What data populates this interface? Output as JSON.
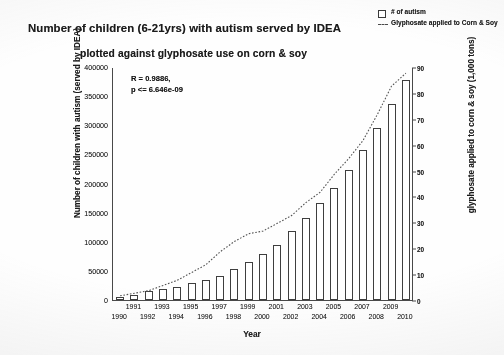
{
  "title": {
    "line1": "Number of children (6-21yrs) with autism served by IDEA",
    "line2": "plotted against glyphosate use on corn & soy"
  },
  "legend": {
    "position": "top-right",
    "items": [
      {
        "label": "# of autism",
        "marker": "open-square",
        "color": "#3f3f3f"
      },
      {
        "label": "Glyphosate applied to Corn & Soy",
        "marker": "dashed-line",
        "color": "#4a4a4a"
      }
    ]
  },
  "annotation": {
    "r_line": "R = 0.9886,",
    "p_line": "p <= 6.646e-09"
  },
  "axes": {
    "x_title": "Year",
    "y_left_title": "Number of children with autism (served by IDEA)",
    "y_right_title": "glyphosate applied to corn & soy (1,000 tons)"
  },
  "chart_data": {
    "type": "bar",
    "title": "Number of children (6-21yrs) with autism served by IDEA plotted against glyphosate use on corn & soy",
    "xlabel": "Year",
    "ylabel": "Number of children with autism (served by IDEA)",
    "y2label": "glyphosate applied to corn & soy (1,000 tons)",
    "ylim": [
      0,
      400000
    ],
    "y2lim": [
      0,
      90
    ],
    "yticks": [
      0,
      50000,
      100000,
      150000,
      200000,
      250000,
      300000,
      350000,
      400000
    ],
    "ytick_labels": [
      "0",
      "50000",
      "100000",
      "150000",
      "200000",
      "250000",
      "300000",
      "350000",
      "400000"
    ],
    "y2ticks": [
      0,
      10,
      20,
      30,
      40,
      50,
      60,
      70,
      80,
      90
    ],
    "y2tick_labels": [
      "0",
      "10",
      "20",
      "30",
      "40",
      "50",
      "60",
      "70",
      "80",
      "90"
    ],
    "grid": false,
    "categories": [
      "1990",
      "1991",
      "1992",
      "1993",
      "1994",
      "1995",
      "1996",
      "1997",
      "1998",
      "1999",
      "2000",
      "2001",
      "2002",
      "2003",
      "2004",
      "2005",
      "2006",
      "2007",
      "2008",
      "2009",
      "2010"
    ],
    "xtick_labels_upper": [
      "1991",
      "1993",
      "1995",
      "1997",
      "1999",
      "2001",
      "2003",
      "2005",
      "2007",
      "2009"
    ],
    "xtick_labels_lower": [
      "1990",
      "1992",
      "1994",
      "1996",
      "1998",
      "2000",
      "2002",
      "2004",
      "2006",
      "2008",
      "2010"
    ],
    "series": [
      {
        "name": "# of autism",
        "type": "bar",
        "axis": "left",
        "values": [
          5000,
          8000,
          15000,
          19000,
          23000,
          29000,
          34000,
          42000,
          53000,
          65000,
          79000,
          94000,
          118000,
          141000,
          166000,
          193000,
          224000,
          258000,
          296000,
          336000,
          378000
        ]
      },
      {
        "name": "Glyphosate applied to Corn & Soy",
        "type": "line",
        "axis": "right",
        "linestyle": "dotted",
        "values": [
          2,
          3,
          4,
          6,
          8,
          11,
          14,
          19,
          23,
          26,
          27,
          30,
          33,
          38,
          42,
          49,
          55,
          62,
          72,
          83,
          88
        ]
      }
    ]
  }
}
